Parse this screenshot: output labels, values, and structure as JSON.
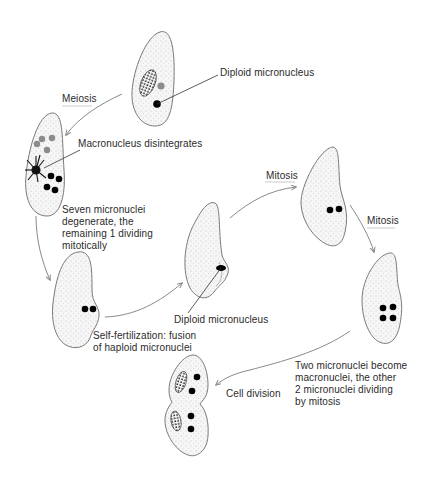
{
  "diagram": {
    "type": "life-cycle",
    "colors": {
      "cell_outline": "#7a7a7a",
      "cell_fill": "#f4f4f4",
      "micronucleus": "#000000",
      "degenerating_nucleus": "#8c8c8c",
      "arrow": "#8a8a8a",
      "label_text": "#2b2b2b",
      "leader_line": "#333333"
    },
    "labels": {
      "diploid_micronucleus_top": "Diploid micronucleus",
      "meiosis": "Meiosis",
      "macronucleus_disintegrates": "Macronucleus disintegrates",
      "seven_micronuclei": [
        "Seven micronuclei",
        "degenerate, the",
        "remaining 1 dividing",
        "mitotically"
      ],
      "self_fertilization": [
        "Self-fertilization: fusion",
        "of haploid micronuclei"
      ],
      "diploid_micronucleus_mid": "Diploid micronucleus",
      "mitosis_1": "Mitosis",
      "mitosis_2": "Mitosis",
      "two_micronuclei": [
        "Two micronuclei become",
        "macronuclei, the other",
        "2 micronuclei dividing",
        "by mitosis"
      ],
      "cell_division": "Cell division"
    },
    "stages": [
      {
        "id": "stage-1",
        "name": "Starting cell",
        "micronuclei": 1,
        "macronucleus": true
      },
      {
        "id": "stage-2",
        "name": "After meiosis",
        "micronuclei": 8,
        "macronucleus": "disintegrating"
      },
      {
        "id": "stage-3",
        "name": "Haploid pair",
        "micronuclei": 2
      },
      {
        "id": "stage-4",
        "name": "Fused diploid",
        "micronuclei": 1
      },
      {
        "id": "stage-5",
        "name": "First mitosis",
        "micronuclei": 2
      },
      {
        "id": "stage-6",
        "name": "Second mitosis",
        "micronuclei": 4
      },
      {
        "id": "stage-7",
        "name": "Cell division",
        "micronuclei": 4,
        "macronuclei": 2
      }
    ]
  }
}
